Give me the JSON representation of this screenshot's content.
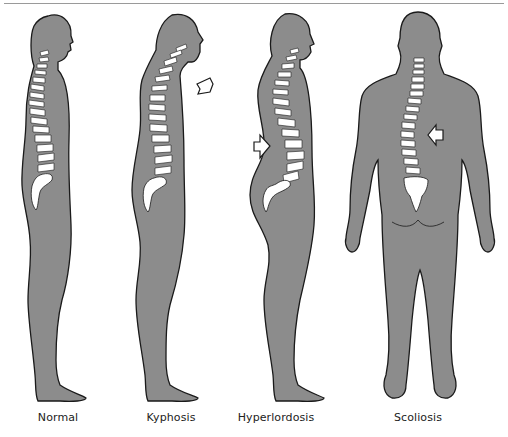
{
  "figure": {
    "body_fill": "#8c8c8c",
    "outline": "#1a1a1a",
    "bone": "#ffffff",
    "panels": [
      {
        "label": "Normal",
        "x": 58
      },
      {
        "label": "Kyphosis",
        "x": 171
      },
      {
        "label": "Hyperlordosis",
        "x": 276
      },
      {
        "label": "Scoliosis",
        "x": 418
      }
    ]
  }
}
